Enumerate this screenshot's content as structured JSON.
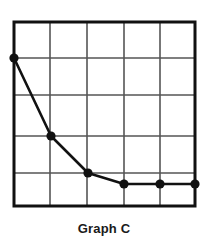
{
  "figure": {
    "caption": "Graph C"
  },
  "chart_data": {
    "type": "line",
    "title": "Graph C",
    "xlabel": "",
    "ylabel": "",
    "xlim": [
      0,
      5
    ],
    "ylim": [
      0,
      5
    ],
    "grid": true,
    "legend": null,
    "xticks": [
      0,
      1,
      2,
      3,
      4,
      5
    ],
    "yticks": [
      0,
      1,
      2,
      3,
      4,
      5
    ],
    "xticklabels": [
      "",
      "",
      "",
      "",
      "",
      ""
    ],
    "yticklabels": [
      "",
      "",
      "",
      "",
      "",
      ""
    ],
    "series": [
      {
        "name": "Graph C",
        "marker": "filled-circle",
        "marker_color": "#111111",
        "line_color": "#111111",
        "x": [
          0,
          1,
          2,
          3,
          4,
          5
        ],
        "y": [
          4,
          2,
          1,
          0.65,
          0.65,
          0.65
        ]
      }
    ],
    "style": {
      "frame_color": "#111111",
      "frame_width_px": 3,
      "grid_color": "#555555",
      "grid_width_px": 1.6,
      "background": "#ffffff",
      "marker_radius_px": 4.6,
      "line_width_px": 2.6
    },
    "geometry": {
      "plot_left_px": 14,
      "plot_top_px": 22,
      "plot_right_px": 195,
      "plot_bottom_px": 206,
      "x_gridlines_px": [
        50,
        87,
        124,
        160
      ],
      "y_gridlines_px": [
        58,
        95,
        136,
        173
      ],
      "points_px": [
        [
          14,
          58
        ],
        [
          51,
          136
        ],
        [
          88,
          173
        ],
        [
          124,
          184
        ],
        [
          160,
          184
        ],
        [
          195,
          184
        ]
      ]
    }
  }
}
